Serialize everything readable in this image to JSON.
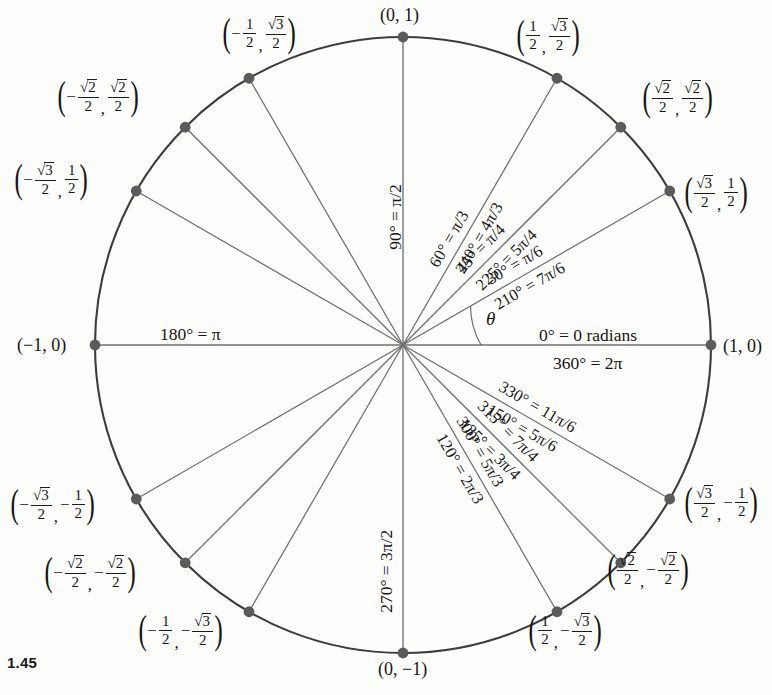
{
  "figure": {
    "number": "1.45",
    "center": {
      "x": 403,
      "y": 345
    },
    "radius": 308,
    "colors": {
      "circle_stroke": "#3c3c3c",
      "ray_stroke": "#6e6f71",
      "axis_stroke": "#6e6f71",
      "point_fill": "#5a5b5d",
      "text": "#151515",
      "background": "#fdfdfc"
    }
  },
  "axis_labels": {
    "zero": "0° = 0 radians",
    "three_sixty": "360° = 2π",
    "one_eighty": "180° = π",
    "ninety": "90° = π/2",
    "two_seventy": "270° = 3π/2",
    "theta": "θ"
  },
  "ray_labels": [
    {
      "angle": 30,
      "text": "30° = π/6"
    },
    {
      "angle": 45,
      "text": "45° = π/4"
    },
    {
      "angle": 60,
      "text": "60° = π/3"
    },
    {
      "angle": 120,
      "text": "120° = 2π/3"
    },
    {
      "angle": 135,
      "text": "135° = 3π/4"
    },
    {
      "angle": 150,
      "text": "150° = 5π/6"
    },
    {
      "angle": 210,
      "text": "210° = 7π/6"
    },
    {
      "angle": 225,
      "text": "225° = 5π/4"
    },
    {
      "angle": 240,
      "text": "240° = 4π/3"
    },
    {
      "angle": 300,
      "text": "300° = 5π/3"
    },
    {
      "angle": 315,
      "text": "315° = 7π/4"
    },
    {
      "angle": 330,
      "text": "330° = 11π/6"
    }
  ],
  "coordinate_labels": [
    {
      "angle": 0,
      "text": "(1, 0)"
    },
    {
      "angle": 90,
      "text": "(0, 1)"
    },
    {
      "angle": 180,
      "text": "(−1, 0)"
    },
    {
      "angle": 270,
      "text": "(0, −1)"
    },
    {
      "angle": 30,
      "x_num": "√3",
      "x_den": "2",
      "x_neg": false,
      "y_num": "1",
      "y_den": "2",
      "y_neg": false
    },
    {
      "angle": 45,
      "x_num": "√2",
      "x_den": "2",
      "x_neg": false,
      "y_num": "√2",
      "y_den": "2",
      "y_neg": false
    },
    {
      "angle": 60,
      "x_num": "1",
      "x_den": "2",
      "x_neg": false,
      "y_num": "√3",
      "y_den": "2",
      "y_neg": false
    },
    {
      "angle": 120,
      "x_num": "1",
      "x_den": "2",
      "x_neg": true,
      "y_num": "√3",
      "y_den": "2",
      "y_neg": false
    },
    {
      "angle": 135,
      "x_num": "√2",
      "x_den": "2",
      "x_neg": true,
      "y_num": "√2",
      "y_den": "2",
      "y_neg": false
    },
    {
      "angle": 150,
      "x_num": "√3",
      "x_den": "2",
      "x_neg": true,
      "y_num": "1",
      "y_den": "2",
      "y_neg": false
    },
    {
      "angle": 210,
      "x_num": "√3",
      "x_den": "2",
      "x_neg": true,
      "y_num": "1",
      "y_den": "2",
      "y_neg": true
    },
    {
      "angle": 225,
      "x_num": "√2",
      "x_den": "2",
      "x_neg": true,
      "y_num": "√2",
      "y_den": "2",
      "y_neg": true
    },
    {
      "angle": 240,
      "x_num": "1",
      "x_den": "2",
      "x_neg": true,
      "y_num": "√3",
      "y_den": "2",
      "y_neg": true
    },
    {
      "angle": 300,
      "x_num": "1",
      "x_den": "2",
      "x_neg": false,
      "y_num": "√3",
      "y_den": "2",
      "y_neg": true
    },
    {
      "angle": 315,
      "x_num": "√2",
      "x_den": "2",
      "x_neg": false,
      "y_num": "√2",
      "y_den": "2",
      "y_neg": true
    },
    {
      "angle": 330,
      "x_num": "√3",
      "x_den": "2",
      "x_neg": false,
      "y_num": "1",
      "y_den": "2",
      "y_neg": true
    }
  ],
  "chart_data": {
    "type": "scatter",
    "xlabel": "x",
    "ylabel": "y",
    "xlim": [
      -1,
      1
    ],
    "ylim": [
      -1,
      1
    ],
    "grid": false,
    "legend": "none",
    "points": [
      {
        "degrees": 0,
        "radians": "0",
        "x": 1.0,
        "y": 0.0
      },
      {
        "degrees": 30,
        "radians": "π/6",
        "x": 0.866,
        "y": 0.5
      },
      {
        "degrees": 45,
        "radians": "π/4",
        "x": 0.7071,
        "y": 0.7071
      },
      {
        "degrees": 60,
        "radians": "π/3",
        "x": 0.5,
        "y": 0.866
      },
      {
        "degrees": 90,
        "radians": "π/2",
        "x": 0.0,
        "y": 1.0
      },
      {
        "degrees": 120,
        "radians": "2π/3",
        "x": -0.5,
        "y": 0.866
      },
      {
        "degrees": 135,
        "radians": "3π/4",
        "x": -0.7071,
        "y": 0.7071
      },
      {
        "degrees": 150,
        "radians": "5π/6",
        "x": -0.866,
        "y": 0.5
      },
      {
        "degrees": 180,
        "radians": "π",
        "x": -1.0,
        "y": 0.0
      },
      {
        "degrees": 210,
        "radians": "7π/6",
        "x": -0.866,
        "y": -0.5
      },
      {
        "degrees": 225,
        "radians": "5π/4",
        "x": -0.7071,
        "y": -0.7071
      },
      {
        "degrees": 240,
        "radians": "4π/3",
        "x": -0.5,
        "y": -0.866
      },
      {
        "degrees": 270,
        "radians": "3π/2",
        "x": 0.0,
        "y": -1.0
      },
      {
        "degrees": 300,
        "radians": "5π/3",
        "x": 0.5,
        "y": -0.866
      },
      {
        "degrees": 315,
        "radians": "7π/4",
        "x": 0.7071,
        "y": -0.7071
      },
      {
        "degrees": 330,
        "radians": "11π/6",
        "x": 0.866,
        "y": -0.5
      },
      {
        "degrees": 360,
        "radians": "2π",
        "x": 1.0,
        "y": 0.0
      }
    ]
  }
}
